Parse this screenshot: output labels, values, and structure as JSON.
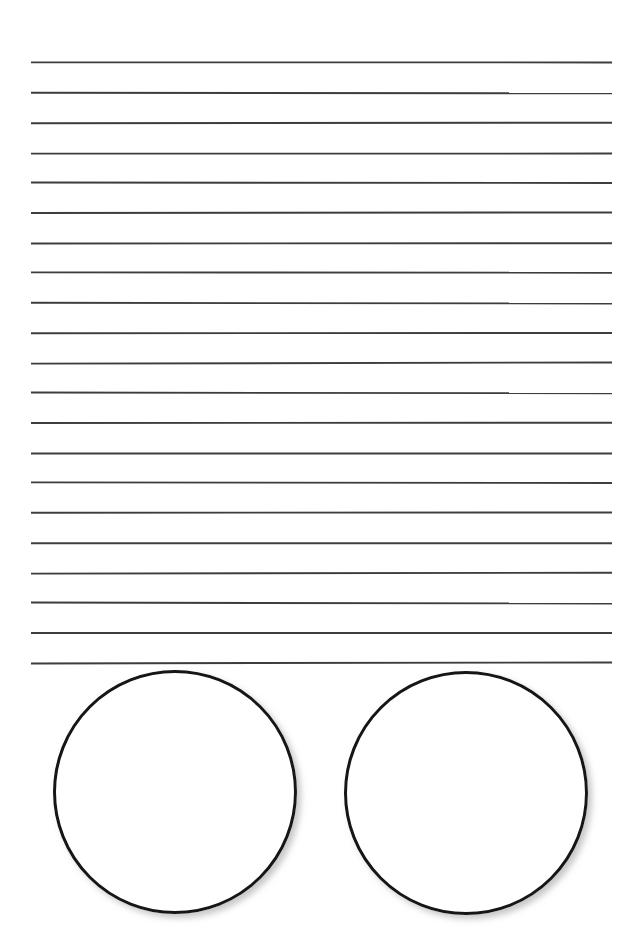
{
  "page": {
    "name": "blank-ruled-worksheet",
    "width": 642,
    "height": 942,
    "background_color": "#ffffff"
  },
  "ruled_lines": {
    "name": "ruled-writing-lines",
    "count": 21,
    "first_line_y": 63,
    "spacing": 30,
    "x_start": 31,
    "x_end": 612,
    "stroke_color": "#3c3c3c",
    "stroke_width": 1.9,
    "y_positions": [
      63,
      93,
      123,
      153,
      183,
      213,
      243,
      273,
      303,
      333,
      363,
      393,
      423,
      453,
      483,
      513,
      543,
      573,
      603,
      633,
      663
    ]
  },
  "circles": {
    "name": "answer-circles",
    "count": 2,
    "stroke_color": "#141414",
    "stroke_width": 3,
    "fill_color": "#ffffff",
    "shadow_color": "#b4b4b4",
    "items": [
      {
        "label": "left-answer-circle",
        "cx": 175,
        "cy": 792,
        "r": 120.5
      },
      {
        "label": "right-answer-circle",
        "cx": 466,
        "cy": 793,
        "r": 120.5
      }
    ]
  }
}
